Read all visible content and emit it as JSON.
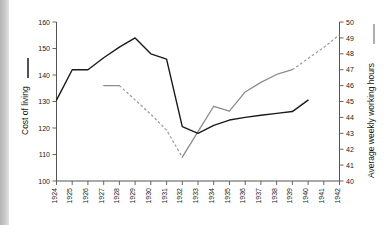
{
  "chart_data": {
    "type": "line",
    "title": "",
    "xlabel": "",
    "x": [
      1924,
      1925,
      1926,
      1927,
      1928,
      1929,
      1930,
      1931,
      1932,
      1933,
      1934,
      1935,
      1936,
      1937,
      1938,
      1939,
      1940,
      1941,
      1942
    ],
    "xticklabels": [
      "1924",
      "1925",
      "1926",
      "1927",
      "1928",
      "1929",
      "1930",
      "1931",
      "1932",
      "1933",
      "1934",
      "1935",
      "1936",
      "1937",
      "1938",
      "1939",
      "1940",
      "1941",
      "1942"
    ],
    "grid": false,
    "legend_position": "axis-titles",
    "axes": {
      "left": {
        "label": "Cost of living",
        "ylim": [
          100,
          160
        ],
        "ticks": [
          100,
          110,
          120,
          130,
          140,
          150,
          160
        ],
        "ticklabels": [
          "100",
          "110",
          "120",
          "130",
          "140",
          "150",
          "160"
        ],
        "color": "#1a1a1a"
      },
      "right": {
        "label": "Average weekly working hours",
        "ylim": [
          40,
          50
        ],
        "ticks": [
          40,
          41,
          42,
          43,
          44,
          45,
          46,
          47,
          48,
          49,
          50
        ],
        "ticklabels": [
          "40",
          "41",
          "42",
          "43",
          "44",
          "45",
          "46",
          "47",
          "48",
          "49",
          "50"
        ],
        "color": "#8c8c8c"
      }
    },
    "series": [
      {
        "name": "Cost of living",
        "axis": "left",
        "color": "#1a1a1a",
        "style": "solid",
        "x": [
          1924,
          1925,
          1926,
          1927,
          1928,
          1929,
          1930,
          1931,
          1932,
          1933,
          1934,
          1935,
          1936,
          1937,
          1938,
          1939,
          1940
        ],
        "values": [
          130.5,
          142.0,
          142.0,
          146.5,
          150.5,
          154.0,
          148.0,
          146.0,
          120.5,
          118.0,
          121.0,
          123.0,
          124.0,
          124.8,
          125.5,
          126.2,
          130.5
        ]
      },
      {
        "name": "Average weekly working hours",
        "axis": "right",
        "color": "#8c8c8c",
        "style": "mixed-solid-dashed",
        "x": [
          1927,
          1928,
          1929,
          1930,
          1931,
          1932,
          1933,
          1934,
          1935,
          1936,
          1937,
          1938,
          1939,
          1940,
          1941,
          1942
        ],
        "values": [
          46.0,
          46.0,
          45.1,
          44.2,
          43.2,
          41.5,
          43.1,
          44.7,
          44.4,
          45.6,
          46.2,
          46.7,
          47.0,
          47.7,
          48.4,
          49.2
        ],
        "solid_segments": [
          [
            1927,
            1928
          ],
          [
            1932,
            1939
          ]
        ],
        "dashed_segments": [
          [
            1928,
            1932
          ],
          [
            1939,
            1942
          ]
        ]
      }
    ]
  }
}
